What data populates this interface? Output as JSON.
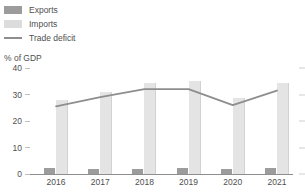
{
  "legend": {
    "position": "top-left",
    "items": [
      {
        "label": "Exports",
        "icon": "square-swatch-dark",
        "color": "#9c9c9c"
      },
      {
        "label": "Imports",
        "icon": "square-swatch-light",
        "color": "#dcdcdc"
      },
      {
        "label": "Trade deficit",
        "icon": "line-swatch",
        "color": "#8e8e8e"
      }
    ]
  },
  "chart_data": {
    "type": "bar",
    "title": "",
    "subtitle": "",
    "xlabel": "",
    "ylabel": "% of GDP",
    "categories": [
      "2016",
      "2017",
      "2018",
      "2019",
      "2020",
      "2021"
    ],
    "ylim": [
      0,
      40
    ],
    "yticks": [
      0,
      10,
      20,
      30,
      40
    ],
    "ytick_labels": [
      "0",
      "10",
      "20",
      "30",
      "40"
    ],
    "grid": false,
    "series": [
      {
        "name": "Exports",
        "type": "bar",
        "color": "#9c9c9c",
        "values": [
          2.2,
          2.0,
          1.9,
          2.2,
          1.8,
          2.4
        ]
      },
      {
        "name": "Imports",
        "type": "bar",
        "color": "#e4e4e4",
        "values": [
          28.0,
          31.0,
          34.5,
          35.0,
          28.5,
          34.5
        ]
      },
      {
        "name": "Trade deficit",
        "type": "line",
        "color": "#8e8e8e",
        "values": [
          25.5,
          29.0,
          32.0,
          32.0,
          26.0,
          31.5
        ]
      }
    ]
  }
}
